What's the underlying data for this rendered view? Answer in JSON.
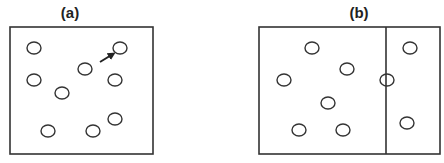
{
  "panels": [
    {
      "id": "a",
      "label": "(a)",
      "box": {
        "x": 10,
        "y": 27,
        "w": 143,
        "h": 127
      },
      "divider": null,
      "circles": [
        [
          34,
          48
        ],
        [
          120,
          48
        ],
        [
          85,
          69
        ],
        [
          34,
          80
        ],
        [
          115,
          80
        ],
        [
          62,
          93
        ],
        [
          115,
          119
        ],
        [
          48,
          131
        ],
        [
          93,
          131
        ]
      ],
      "arrow": {
        "from": [
          100,
          62
        ],
        "to": [
          113,
          54
        ]
      }
    },
    {
      "id": "b",
      "label": "(b)",
      "box": {
        "x": 259,
        "y": 27,
        "w": 181,
        "h": 127
      },
      "divider": {
        "x": 386
      },
      "circles": [
        [
          312,
          48
        ],
        [
          410,
          48
        ],
        [
          347,
          69
        ],
        [
          284,
          80
        ],
        [
          387,
          80
        ],
        [
          328,
          103
        ],
        [
          407,
          123
        ],
        [
          299,
          130
        ],
        [
          343,
          130
        ]
      ],
      "arrow": null
    }
  ],
  "style": {
    "stroke": "#333333",
    "circle_radius_x": 7,
    "circle_radius_y": 6
  }
}
